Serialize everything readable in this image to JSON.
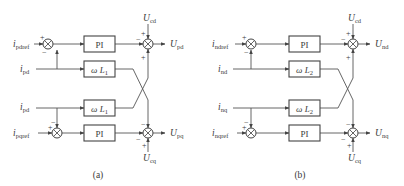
{
  "figure": {
    "panels": [
      {
        "id": "a",
        "caption": "(a)",
        "inputs": {
          "d_ref": {
            "main": "i",
            "sub": "pdref"
          },
          "d_meas": {
            "main": "i",
            "sub": "pd"
          },
          "q_meas": {
            "main": "i",
            "sub": "pd"
          },
          "q_ref": {
            "main": "i",
            "sub": "pqref"
          }
        },
        "blocks": {
          "pi_top": "PI",
          "coupling_top": {
            "omega": "ω",
            "L": "L",
            "sub": "1"
          },
          "coupling_bottom": {
            "omega": "ω",
            "L": "L",
            "sub": "1"
          },
          "pi_bottom": "PI"
        },
        "feedforward": {
          "top": {
            "main": "U",
            "sub": "cd"
          },
          "bottom": {
            "main": "U",
            "sub": "cq"
          }
        },
        "outputs": {
          "top": {
            "main": "U",
            "sub": "pd"
          },
          "bottom": {
            "main": "U",
            "sub": "pq"
          }
        },
        "signs": {
          "left_top_in": "+",
          "left_top_fb": "−",
          "left_bot_fb": "−",
          "left_bot_in": "+",
          "right_top_ff": "+",
          "right_top_pi": "−",
          "right_top_cross": "+",
          "right_bot_cross": "−",
          "right_bot_pi": "−",
          "right_bot_ff": "+"
        }
      },
      {
        "id": "b",
        "caption": "(b)",
        "inputs": {
          "d_ref": {
            "main": "i",
            "sub": "ndref"
          },
          "d_meas": {
            "main": "i",
            "sub": "nd"
          },
          "q_meas": {
            "main": "i",
            "sub": "nq"
          },
          "q_ref": {
            "main": "i",
            "sub": "nqref"
          }
        },
        "blocks": {
          "pi_top": "PI",
          "coupling_top": {
            "omega": "ω",
            "L": "L",
            "sub": "2"
          },
          "coupling_bottom": {
            "omega": "ω",
            "L": "L",
            "sub": "2"
          },
          "pi_bottom": "PI"
        },
        "feedforward": {
          "top": {
            "main": "U",
            "sub": "cd"
          },
          "bottom": {
            "main": "U",
            "sub": "cq"
          }
        },
        "outputs": {
          "top": {
            "main": "U",
            "sub": "nd"
          },
          "bottom": {
            "main": "U",
            "sub": "nq"
          }
        },
        "signs": {
          "left_top_in": "+",
          "left_top_fb": "−",
          "left_bot_fb": "−",
          "left_bot_in": "+",
          "right_top_ff": "+",
          "right_top_pi": "−",
          "right_top_cross": "+",
          "right_bot_cross": "−",
          "right_bot_pi": "−",
          "right_bot_ff": "+"
        }
      }
    ],
    "colors": {
      "line": "#555555",
      "text": "#3a3a3a",
      "background": "#ffffff"
    }
  }
}
